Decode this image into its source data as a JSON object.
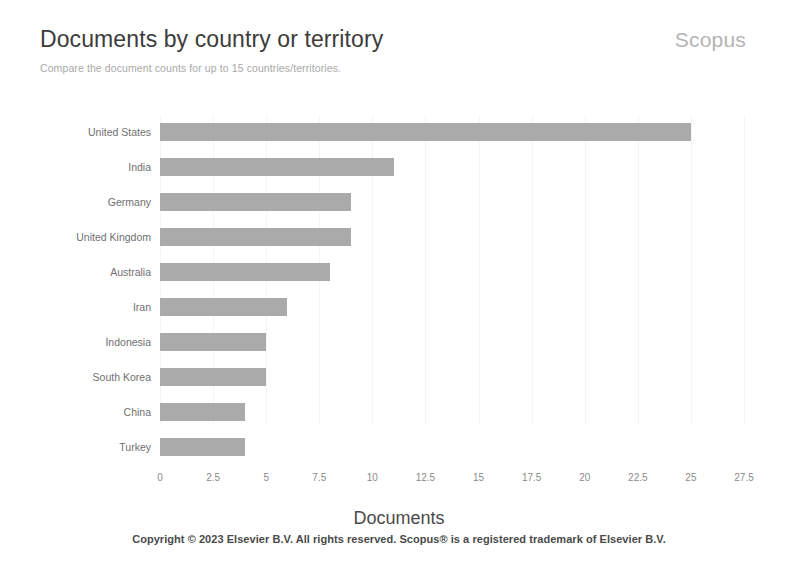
{
  "header": {
    "title": "Documents by country or territory",
    "subtitle": "Compare the document counts for up to 15 countries/territories.",
    "brand": "Scopus"
  },
  "footer": {
    "copyright": "Copyright © 2023 Elsevier B.V. All rights reserved. Scopus® is a registered trademark of Elsevier B.V."
  },
  "colors": {
    "bar": "#aaaaaa",
    "background": "#ffffff",
    "title_text": "#3c3c3c",
    "subtitle_text": "#a9a9a9",
    "brand_text": "#b4b4b4",
    "tick_text": "#8a8a8a",
    "category_text": "#6f6f6f"
  },
  "chart_data": {
    "type": "bar",
    "orientation": "horizontal",
    "title": "Documents by country or territory",
    "subtitle": "Compare the document counts for up to 15 countries/territories.",
    "xlabel": "Documents",
    "ylabel": "",
    "categories": [
      "United States",
      "India",
      "Germany",
      "United Kingdom",
      "Australia",
      "Iran",
      "Indonesia",
      "South Korea",
      "China",
      "Turkey"
    ],
    "values": [
      25,
      11,
      9,
      9,
      8,
      6,
      5,
      5,
      4,
      4
    ],
    "xlim": [
      0,
      27.5
    ],
    "xticks": [
      0,
      2.5,
      5,
      7.5,
      10,
      12.5,
      15,
      17.5,
      20,
      22.5,
      25,
      27.5
    ],
    "xtick_labels": [
      "0",
      "2.5",
      "5",
      "7.5",
      "10",
      "12.5",
      "15",
      "17.5",
      "20",
      "22.5",
      "25",
      "27.5"
    ],
    "grid": true,
    "legend": false
  }
}
